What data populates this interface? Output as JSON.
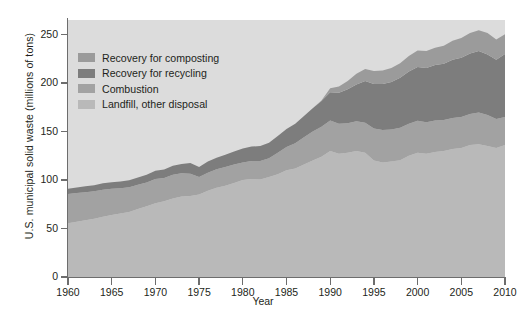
{
  "chart_data": {
    "type": "area",
    "title": "",
    "xlabel": "Year",
    "ylabel": "U.S. municipal solid waste (millions of tons)",
    "xlim": [
      1960,
      2010
    ],
    "ylim": [
      0,
      265
    ],
    "xticks": [
      1960,
      1965,
      1970,
      1975,
      1980,
      1985,
      1990,
      1995,
      2000,
      2005,
      2010
    ],
    "yticks": [
      0,
      50,
      100,
      150,
      200,
      250
    ],
    "grid": false,
    "legend_position": "upper-left",
    "stacked": true,
    "stack_order_bottom_to_top": [
      "Landfill, other disposal",
      "Combustion",
      "Recovery for recycling",
      "Recovery for composting"
    ],
    "x": [
      1960,
      1961,
      1962,
      1963,
      1964,
      1965,
      1966,
      1967,
      1968,
      1969,
      1970,
      1971,
      1972,
      1973,
      1974,
      1975,
      1976,
      1977,
      1978,
      1979,
      1980,
      1981,
      1982,
      1983,
      1984,
      1985,
      1986,
      1987,
      1988,
      1989,
      1990,
      1991,
      1992,
      1993,
      1994,
      1995,
      1996,
      1997,
      1998,
      1999,
      2000,
      2001,
      2002,
      2003,
      2004,
      2005,
      2006,
      2007,
      2008,
      2009,
      2010
    ],
    "series": [
      {
        "name": "Landfill, other disposal",
        "color": "#b9b9b9",
        "values": [
          55.5,
          57.0,
          58.5,
          60.0,
          62.0,
          64.0,
          65.5,
          67.0,
          70.0,
          73.0,
          76.0,
          78.0,
          81.0,
          83.0,
          83.5,
          85.0,
          89.0,
          92.0,
          94.0,
          97.0,
          100.0,
          101.0,
          100.5,
          103.0,
          106.0,
          110.0,
          112.0,
          116.0,
          120.0,
          124.0,
          130.0,
          127.0,
          128.0,
          130.0,
          128.0,
          120.0,
          118.0,
          119.0,
          120.5,
          125.0,
          128.0,
          127.0,
          129.0,
          130.0,
          132.0,
          133.0,
          136.0,
          137.0,
          135.0,
          133.0,
          136.0
        ]
      },
      {
        "name": "Combustion",
        "color": "#a2a2a2",
        "values": [
          30.0,
          29.5,
          29.0,
          28.5,
          28.0,
          27.0,
          26.0,
          25.5,
          25.0,
          24.5,
          25.0,
          24.0,
          24.5,
          24.0,
          23.0,
          18.0,
          18.5,
          19.0,
          19.5,
          19.0,
          18.0,
          18.5,
          19.0,
          19.5,
          22.0,
          24.0,
          26.0,
          28.0,
          30.0,
          31.0,
          31.5,
          31.0,
          30.5,
          30.5,
          31.0,
          33.0,
          33.5,
          33.0,
          33.5,
          33.0,
          33.0,
          32.5,
          32.5,
          32.0,
          32.0,
          32.0,
          32.0,
          32.5,
          32.0,
          30.0,
          29.0
        ]
      },
      {
        "name": "Recovery for recycling",
        "color": "#7d7d7d",
        "values": [
          5.6,
          5.8,
          6.0,
          6.2,
          6.6,
          6.8,
          7.0,
          7.3,
          7.6,
          8.0,
          8.5,
          8.8,
          9.2,
          9.6,
          11.0,
          10.5,
          11.5,
          12.0,
          12.5,
          13.5,
          14.5,
          15.0,
          15.5,
          16.0,
          17.5,
          18.5,
          20.0,
          22.0,
          24.0,
          26.5,
          29.0,
          32.0,
          35.0,
          38.0,
          43.0,
          46.0,
          47.5,
          49.0,
          51.5,
          54.0,
          55.5,
          56.0,
          57.0,
          58.0,
          60.0,
          61.0,
          62.5,
          63.5,
          62.5,
          61.0,
          65.0
        ]
      },
      {
        "name": "Recovery for composting",
        "color": "#9b9b9b",
        "values": [
          0.0,
          0.0,
          0.0,
          0.0,
          0.0,
          0.0,
          0.0,
          0.0,
          0.0,
          0.0,
          0.0,
          0.0,
          0.0,
          0.0,
          0.0,
          0.0,
          0.0,
          0.0,
          0.0,
          0.0,
          0.0,
          0.0,
          0.0,
          0.0,
          0.0,
          0.0,
          0.0,
          0.0,
          0.0,
          0.5,
          4.2,
          6.5,
          8.5,
          11.0,
          12.5,
          13.5,
          14.0,
          14.5,
          15.0,
          16.0,
          17.0,
          17.5,
          18.0,
          18.5,
          19.5,
          20.5,
          21.0,
          21.5,
          22.0,
          21.0,
          20.2
        ]
      }
    ]
  },
  "legend": {
    "items": [
      {
        "label": "Recovery for composting",
        "color": "#9b9b9b"
      },
      {
        "label": "Recovery for recycling",
        "color": "#7d7d7d"
      },
      {
        "label": "Combustion",
        "color": "#a2a2a2"
      },
      {
        "label": "Landfill, other disposal",
        "color": "#b9b9b9"
      }
    ]
  },
  "style": {
    "plot_background": "#dcdcdc",
    "axis_color": "#6d6d6d",
    "text_color": "#231f20"
  }
}
